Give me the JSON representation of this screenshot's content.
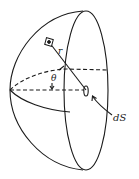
{
  "diagram": {
    "type": "hemisphere-geometry",
    "labels": {
      "radius": "r",
      "angle": "θ",
      "surface_element": "dS"
    },
    "colors": {
      "stroke": "#1a1a1a",
      "background": "#ffffff"
    }
  }
}
